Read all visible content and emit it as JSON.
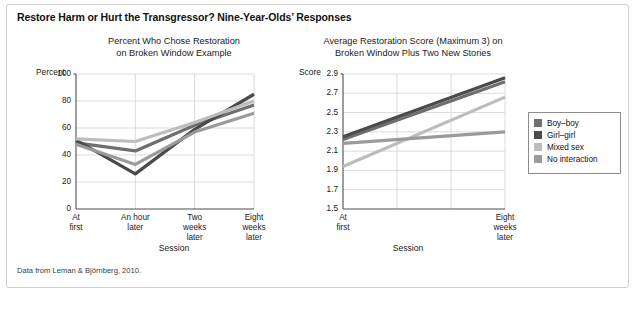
{
  "figure": {
    "title": "Restore Harm or Hurt the Transgressor? Nine-Year-Olds’ Responses",
    "footer": "Data from Leman & Björnberg, 2010."
  },
  "legend": {
    "position": "right",
    "entries": [
      {
        "label": "Boy–boy",
        "color": "#6f6f6f"
      },
      {
        "label": "Girl–girl",
        "color": "#4a4a4a"
      },
      {
        "label": "Mixed sex",
        "color": "#bdbdbd"
      },
      {
        "label": "No interaction",
        "color": "#9a9a9a"
      }
    ]
  },
  "chart_data": [
    {
      "id": "left",
      "type": "line",
      "title": "Percent Who Chose Restoration on Broken Window Example",
      "title_lines": [
        "Percent Who Chose Restoration",
        "on Broken Window Example"
      ],
      "ylabel": "Percent",
      "xlabel": "Session",
      "categories": [
        "At first",
        "An hour later",
        "Two weeks later",
        "Eight weeks later"
      ],
      "category_lines": [
        [
          "At",
          "first"
        ],
        [
          "An hour",
          "later"
        ],
        [
          "Two",
          "weeks",
          "later"
        ],
        [
          "Eight",
          "weeks",
          "later"
        ]
      ],
      "ylim": [
        0,
        100
      ],
      "yticks": [
        0,
        20,
        40,
        60,
        80,
        100
      ],
      "grid": true,
      "series": [
        {
          "name": "Boy–boy",
          "color": "#6f6f6f",
          "values": [
            49,
            43,
            62,
            77
          ]
        },
        {
          "name": "Girl–girl",
          "color": "#4a4a4a",
          "values": [
            51,
            26,
            59,
            85
          ]
        },
        {
          "name": "Mixed sex",
          "color": "#bdbdbd",
          "values": [
            52,
            50,
            64,
            80
          ]
        },
        {
          "name": "No interaction",
          "color": "#9a9a9a",
          "values": [
            48,
            33,
            57,
            71
          ]
        }
      ]
    },
    {
      "id": "right",
      "type": "line",
      "title": "Average Restoration Score (Maximum 3) on Broken Window Plus Two New Stories",
      "title_lines": [
        "Average Restoration Score (Maximum 3) on",
        "Broken Window Plus Two New Stories"
      ],
      "ylabel": "Score",
      "xlabel": "Session",
      "categories": [
        "At first",
        "Eight weeks later"
      ],
      "category_lines": [
        [
          "At",
          "first"
        ],
        [
          "Eight",
          "weeks",
          "later"
        ]
      ],
      "ylim": [
        1.5,
        2.9
      ],
      "yticks": [
        "1.5",
        "1.7",
        "1.9",
        "2.1",
        "2.3",
        "2.5",
        "2.7",
        "2.9"
      ],
      "ytick_values": [
        1.5,
        1.7,
        1.9,
        2.1,
        2.3,
        2.5,
        2.7,
        2.9
      ],
      "grid": true,
      "series": [
        {
          "name": "Boy–boy",
          "color": "#6f6f6f",
          "values": [
            2.22,
            2.82
          ]
        },
        {
          "name": "Girl–girl",
          "color": "#4a4a4a",
          "values": [
            2.25,
            2.86
          ]
        },
        {
          "name": "Mixed sex",
          "color": "#bdbdbd",
          "values": [
            1.94,
            2.66
          ]
        },
        {
          "name": "No interaction",
          "color": "#9a9a9a",
          "values": [
            2.18,
            2.3
          ]
        }
      ]
    }
  ]
}
